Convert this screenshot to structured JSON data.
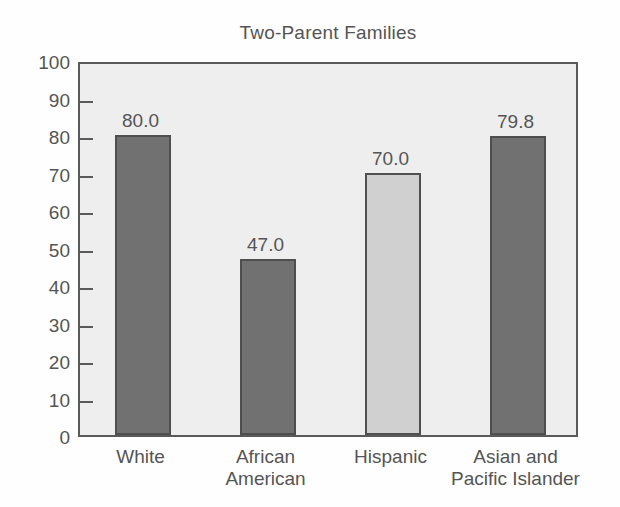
{
  "chart_data": {
    "type": "bar",
    "title": "Two-Parent Families",
    "xlabel": "",
    "ylabel": "",
    "ylim": [
      0,
      100
    ],
    "ytick_step": 10,
    "yticks": [
      0,
      10,
      20,
      30,
      40,
      50,
      60,
      70,
      80,
      90,
      100
    ],
    "ytick_labels": [
      "0",
      "10",
      "20",
      "30",
      "40",
      "50",
      "60",
      "70",
      "80",
      "90",
      "100"
    ],
    "grid": false,
    "legend": "none",
    "categories": [
      "White",
      "African American",
      "Hispanic",
      "Asian and Pacific Islander"
    ],
    "category_lines": [
      [
        "White"
      ],
      [
        "African",
        "American"
      ],
      [
        "Hispanic"
      ],
      [
        "Asian and",
        "Pacific Islander"
      ]
    ],
    "values": [
      80.0,
      47.0,
      70.0,
      79.8
    ],
    "value_labels": [
      "80.0",
      "47.0",
      "70.0",
      "79.8"
    ],
    "bar_styles": [
      "dark",
      "dark",
      "light",
      "dark"
    ],
    "colors": {
      "bar_dark": "#717171",
      "bar_light": "#d0d0d0",
      "bar_border": "#4f4f4f",
      "plot_background": "#eeeeee",
      "axis": "#5a5a5a",
      "text": "#555555",
      "page_background": "#fefefe"
    }
  }
}
